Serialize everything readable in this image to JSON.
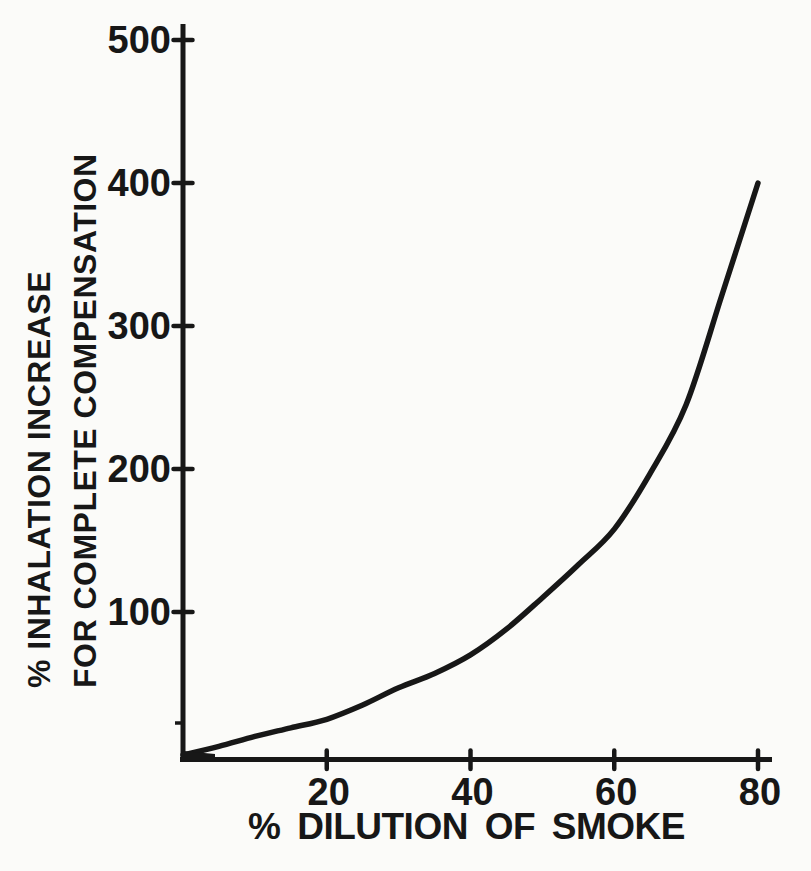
{
  "style": {
    "paper": "#fbfbf9",
    "ink": "#171717"
  },
  "chart_data": {
    "type": "line",
    "title": "",
    "xlabel": "% DILUTION OF SMOKE",
    "ylabel_lines": [
      "% INHALATION INCREASE",
      "FOR COMPLETE COMPENSATION"
    ],
    "xlim": [
      0,
      80
    ],
    "ylim": [
      0,
      500
    ],
    "x_ticks": [
      20,
      40,
      60,
      80
    ],
    "y_ticks": [
      100,
      200,
      300,
      400,
      500
    ],
    "grid": false,
    "legend": "none",
    "series": [
      {
        "name": "% inhalation increase for complete compensation vs % dilution of smoke",
        "x": [
          0,
          5,
          10,
          15,
          20,
          25,
          30,
          35,
          40,
          45,
          50,
          55,
          60,
          65,
          70,
          75,
          80
        ],
        "y": [
          0,
          6,
          13,
          19,
          25,
          35,
          47,
          57,
          70,
          88,
          110,
          133,
          158,
          197,
          245,
          322,
          400
        ]
      }
    ]
  }
}
